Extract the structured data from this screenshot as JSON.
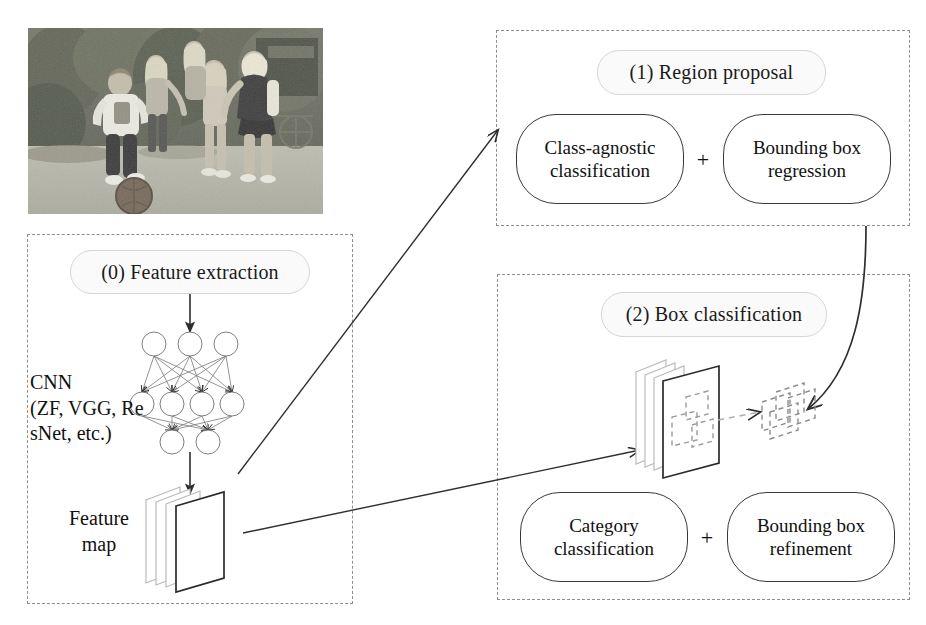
{
  "figure": {
    "type": "flow-diagram",
    "background": "#ffffff",
    "ink_color": "#111111",
    "dashed_border_color": "#8f8f8f",
    "pill_fill": "#fafafa"
  },
  "input_photo": {
    "name": "input-image",
    "caption": "",
    "description": "grayscale photo of children playing soccer on grass"
  },
  "stage0": {
    "header": "(0) Feature extraction",
    "backbone_label": "CNN\n(ZF, VGG, Re\nsNet, etc.)",
    "feature_map_label": "Feature\nmap",
    "network": {
      "layers": [
        3,
        4,
        2
      ]
    }
  },
  "stage1": {
    "header": "(1) Region proposal",
    "operations": [
      {
        "line1": "Class-agnostic",
        "line2": "classification"
      },
      {
        "line1": "Bounding box",
        "line2": "regression"
      }
    ],
    "operator": "+"
  },
  "stage2": {
    "header": "(2) Box classification",
    "operations": [
      {
        "line1": "Category",
        "line2": "classification"
      },
      {
        "line1": "Bounding box",
        "line2": "refinement"
      }
    ],
    "operator": "+"
  },
  "arrows": [
    {
      "name": "arrow-header0-to-cnn",
      "kind": "straight-down"
    },
    {
      "name": "arrow-cnn-to-feature-map",
      "kind": "straight-down"
    },
    {
      "name": "arrow-feature-map-to-region-proposal",
      "kind": "diagonal-up-right"
    },
    {
      "name": "arrow-feature-map-to-box-classification",
      "kind": "diagonal-right"
    },
    {
      "name": "arrow-region-proposal-to-proposals",
      "kind": "curved-down-left"
    },
    {
      "name": "connector-proposals-to-feature-map",
      "kind": "dashed"
    }
  ]
}
